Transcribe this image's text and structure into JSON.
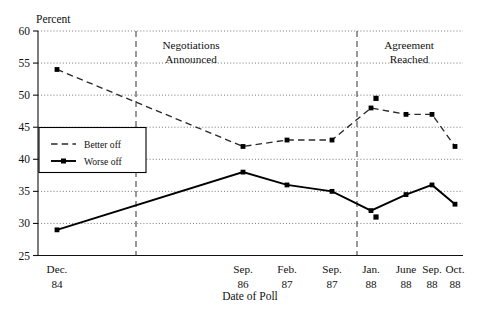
{
  "chart_data": {
    "type": "line",
    "title": "",
    "xlabel": "Date of Poll",
    "ylabel": "Percent",
    "ylim": [
      25,
      60
    ],
    "yticks": [
      25,
      30,
      35,
      40,
      45,
      50,
      55,
      60
    ],
    "grid": true,
    "legend_position": "inner-left",
    "categories": [
      "Dec. 84",
      "Sep. 86",
      "Feb. 87",
      "Sep. 87",
      "Jan. 88",
      "June 88",
      "Sep. 88",
      "Oct. 88"
    ],
    "x_tick_labels": [
      {
        "month": "Dec.",
        "year": "84"
      },
      {
        "month": "Sep.",
        "year": "86"
      },
      {
        "month": "Feb.",
        "year": "87"
      },
      {
        "month": "Sep.",
        "year": "87"
      },
      {
        "month": "Jan.",
        "year": "88"
      },
      {
        "month": "June",
        "year": "88"
      },
      {
        "month": "Sep.",
        "year": "88"
      },
      {
        "month": "Oct.",
        "year": "88"
      }
    ],
    "series": [
      {
        "name": "Better off",
        "style": "dashed",
        "values": [
          54,
          42,
          43,
          43,
          48,
          47,
          47,
          42
        ]
      },
      {
        "name": "Worse off",
        "style": "solid",
        "values": [
          29,
          38,
          36,
          35,
          32,
          34.5,
          36,
          33
        ]
      }
    ],
    "extra_points": [
      {
        "category": "Jan. 88",
        "value": 49.5,
        "series": "Better off"
      },
      {
        "category": "Jan. 88",
        "value": 31,
        "series": "Worse off"
      }
    ],
    "annotations": [
      {
        "line1": "Negotiations",
        "line2": "Announced",
        "at_category_between": "Dec. 84 - Sep. 86"
      },
      {
        "line1": "Agreement",
        "line2": "Reached",
        "at_category_between": "Sep. 87 - Jan. 88"
      }
    ],
    "legend": [
      {
        "label": "Better off",
        "style": "dashed"
      },
      {
        "label": "Worse off",
        "style": "solid"
      }
    ]
  }
}
